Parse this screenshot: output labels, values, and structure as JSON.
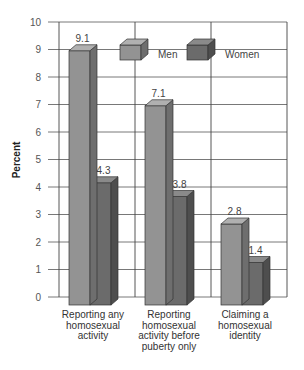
{
  "chart_data": {
    "type": "bar",
    "style": "3d-clustered-column",
    "title": "",
    "xlabel": "",
    "ylabel": "Percent",
    "ylim": [
      0,
      10
    ],
    "yticks": [
      0,
      1,
      2,
      3,
      4,
      5,
      6,
      7,
      8,
      9,
      10
    ],
    "grid": true,
    "legend_position": "top-right inside plot",
    "categories": [
      [
        "Reporting any",
        "homosexual",
        "activity"
      ],
      [
        "Reporting",
        "homosexual",
        "activity before",
        "puberty only"
      ],
      [
        "Claiming a",
        "homosexual",
        "identity"
      ]
    ],
    "series": [
      {
        "name": "Men",
        "values": [
          9.1,
          7.1,
          2.8
        ],
        "color": "#8f8f8f"
      },
      {
        "name": "Women",
        "values": [
          4.3,
          3.8,
          1.4
        ],
        "color": "#6a6a6a"
      }
    ]
  },
  "legend": {
    "men": "Men",
    "women": "Women"
  },
  "axis": {
    "ylabel": "Percent"
  }
}
